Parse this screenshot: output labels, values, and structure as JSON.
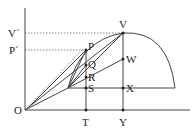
{
  "diagram": {
    "type": "geometry-projectile",
    "labels": {
      "V_prime": "V´",
      "P_prime": "P´",
      "O": "O",
      "P": "P",
      "Q": "Q",
      "R": "R",
      "S": "S",
      "T": "T",
      "V": "V",
      "W": "W",
      "X": "X",
      "Y": "Y"
    },
    "points": {
      "O": [
        25,
        110
      ],
      "P": [
        86,
        50
      ],
      "Q": [
        86,
        65
      ],
      "R": [
        86,
        77
      ],
      "S": [
        86,
        88
      ],
      "T": [
        86,
        110
      ],
      "V": [
        123,
        33
      ],
      "W": [
        123,
        59
      ],
      "X": [
        123,
        88
      ],
      "Y": [
        123,
        110
      ],
      "A": [
        68,
        88
      ]
    },
    "colors": {
      "stroke": "#444444",
      "text": "#222222",
      "background": "#ffffff"
    }
  }
}
